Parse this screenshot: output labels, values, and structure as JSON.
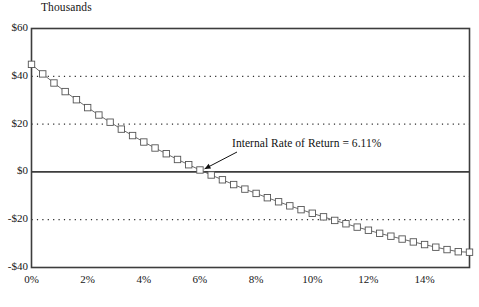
{
  "chart_data": {
    "type": "line",
    "title": "",
    "subtitle": "",
    "unit_label": "Thousands",
    "xlabel": "",
    "ylabel": "",
    "xlim": [
      0,
      15.6
    ],
    "ylim": [
      -40,
      60
    ],
    "grid": true,
    "gridlines_y": [
      40,
      20,
      -20
    ],
    "zero_line_y": 0,
    "legend": "none",
    "marker": "open-square",
    "series": [
      {
        "name": "Net Present Value",
        "x": [
          0.0,
          0.4,
          0.8,
          1.2,
          1.6,
          2.0,
          2.4,
          2.8,
          3.2,
          3.6,
          4.0,
          4.4,
          4.8,
          5.2,
          5.6,
          6.0,
          6.4,
          6.8,
          7.2,
          7.6,
          8.0,
          8.4,
          8.8,
          9.2,
          9.6,
          10.0,
          10.4,
          10.8,
          11.2,
          11.6,
          12.0,
          12.4,
          12.8,
          13.2,
          13.6,
          14.0,
          14.4,
          14.8,
          15.2,
          15.6
        ],
        "values": [
          45.0,
          41.0,
          37.2,
          33.6,
          30.2,
          26.9,
          23.8,
          20.8,
          17.9,
          15.2,
          12.5,
          10.0,
          7.6,
          5.2,
          3.0,
          0.8,
          -1.3,
          -3.3,
          -5.3,
          -7.2,
          -9.0,
          -10.8,
          -12.5,
          -14.2,
          -15.8,
          -17.3,
          -18.8,
          -20.3,
          -21.7,
          -23.1,
          -24.4,
          -25.7,
          -26.9,
          -28.1,
          -29.3,
          -30.4,
          -31.5,
          -32.5,
          -33.4,
          -33.6
        ]
      }
    ],
    "ytick_labels": [
      "$60",
      "$40",
      "$20",
      "$0",
      "-$20",
      "-$40"
    ],
    "ytick_values": [
      60,
      40,
      20,
      0,
      -20,
      -40
    ],
    "xtick_labels": [
      "0%",
      "2%",
      "4%",
      "6%",
      "8%",
      "10%",
      "12%",
      "14%"
    ],
    "xtick_values": [
      0,
      2,
      4,
      6,
      8,
      10,
      12,
      14
    ],
    "annotations": [
      {
        "text": "Internal Rate of Return = 6.11%",
        "x": 6.11,
        "y": 0,
        "label_x": 232,
        "label_y": 137
      }
    ],
    "colors": {
      "axis": "#3d3d3d",
      "line": "#5a5a5a",
      "marker_stroke": "#555555",
      "marker_fill": "#ffffff",
      "grid": "#2b2b2b",
      "text": "#161616"
    }
  }
}
